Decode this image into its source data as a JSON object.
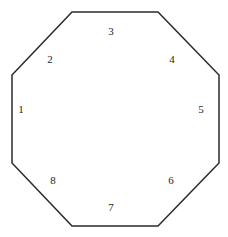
{
  "figure": {
    "width": 228,
    "height": 237,
    "background_color": "#ffffff",
    "stroke_color": "#2a2a2a",
    "stroke_width": 1.5,
    "fill_color": "none",
    "label_color": "#1d1d1d",
    "label_font_size": 11
  },
  "shape": {
    "type": "octagon",
    "sides": 8,
    "vertices": [
      {
        "name": "top-left",
        "x": 72,
        "y": 12
      },
      {
        "name": "top-right",
        "x": 158,
        "y": 12
      },
      {
        "name": "upper-right",
        "x": 219,
        "y": 75
      },
      {
        "name": "lower-right",
        "x": 219,
        "y": 163
      },
      {
        "name": "bottom-right",
        "x": 158,
        "y": 226
      },
      {
        "name": "bottom-left",
        "x": 72,
        "y": 226
      },
      {
        "name": "lower-left",
        "x": 12,
        "y": 163
      },
      {
        "name": "upper-left",
        "x": 12,
        "y": 75
      }
    ],
    "points_attr": "72,12 158,12 219,75 219,163 158,226 72,226 12,163 12,75"
  },
  "labels": [
    {
      "id": "side-1",
      "text": "1",
      "x": 21,
      "y": 109,
      "edge": "left-vertical"
    },
    {
      "id": "side-2",
      "text": "2",
      "x": 50,
      "y": 59,
      "edge": "upper-left-diagonal"
    },
    {
      "id": "side-3",
      "text": "3",
      "x": 111,
      "y": 31,
      "edge": "top-horizontal"
    },
    {
      "id": "side-4",
      "text": "4",
      "x": 172,
      "y": 59,
      "edge": "upper-right-diagonal"
    },
    {
      "id": "side-5",
      "text": "5",
      "x": 201,
      "y": 109,
      "edge": "right-vertical"
    },
    {
      "id": "side-6",
      "text": "6",
      "x": 171,
      "y": 180,
      "edge": "lower-right-diagonal"
    },
    {
      "id": "side-7",
      "text": "7",
      "x": 111,
      "y": 207,
      "edge": "bottom-horizontal"
    },
    {
      "id": "side-8",
      "text": "8",
      "x": 53,
      "y": 180,
      "edge": "lower-left-diagonal"
    }
  ]
}
